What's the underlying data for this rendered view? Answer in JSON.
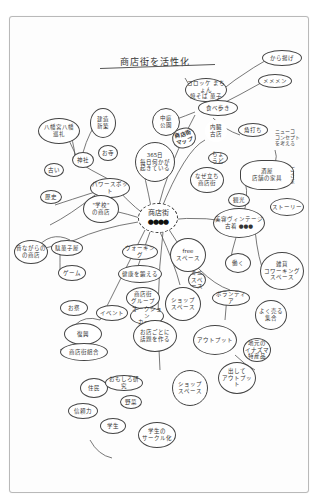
{
  "title": "商店街を活性化",
  "center": {
    "label": "商店街",
    "marks": "●●●●"
  },
  "nodes": {
    "korokke": "コロッケ まちょん\n焼そば 菓子",
    "taberu": "食べ歩き",
    "kara": "から揚げ",
    "menmen": "メメメン",
    "kakuuchi": "角打ち",
    "sandan": "中庭\n公園",
    "shotengai_map": "商店街\nマップ",
    "naigai": "内臓\n古店",
    "oshie": "ちょうど",
    "yobare": "なぜ立ち\n商店街",
    "history": "365日\n毎日何かが\n起きている",
    "power_spot": "パワースポット",
    "jinja": "神社",
    "otera": "お寺",
    "kenzou": "建造\n新築",
    "hachiman": "八幡宮八幡\n巡礼",
    "furui": "古い",
    "rekishi": "歴史",
    "gakko": "\"学校\"\nの商店",
    "mukashi": "昔ながらの\nの商店",
    "dagashi": "駄菓子屋",
    "game": "ゲーム",
    "walking": "ウォーキング",
    "kenko": "健康を鍛える",
    "group": "商店街\nグループ",
    "event": "イベント",
    "oshokuji": "オークション\nカード",
    "omise": "お店ごとに\n話題を作る",
    "free_space": "free\nスペース",
    "small": "ミニ\nスペース",
    "shop_space": "ショップ\nスペース",
    "kanko": "観光",
    "bobi": "美容ヴィンテージ\n古着 ●●●",
    "jikan": "時間",
    "story": "ストーリー",
    "sakaba": "酒屋\n店舗の家具",
    "hataraku": "働く",
    "coworking": "雑貨\nコワーキング\nスペース",
    "borantia": "ボランティア",
    "goods": "よく売る\n集合",
    "output": "アウトプット",
    "oishii": "地元の\nイナズマ\n特産品",
    "dashite": "出して\nアウトプット",
    "shop_space2": "ショップ\nスペース",
    "omatsuri": "お祭",
    "fukko": "復興",
    "shotengai_kumiai": "商店街組合",
    "jumin": "住民",
    "omosiro": "おもしろ研究",
    "shinrai": "信頼力",
    "yasai": "野菜",
    "gakusei": "学生",
    "gakusei_sns": "学生の\nサークル化"
  },
  "notes": {
    "concept": "ニューコ\nコンセプト\nを考える",
    "side": "ご\nさ\nま"
  }
}
